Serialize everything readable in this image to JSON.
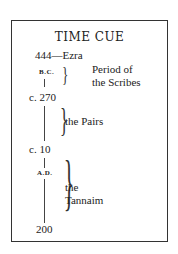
{
  "title": "TIME CUE",
  "timeline": {
    "start": "444—Ezra",
    "bc_label": "B.C.",
    "c270": "c. 270",
    "c10": "c. 10",
    "ad_label": "A.D.",
    "end": "200"
  },
  "periods": [
    {
      "line1": "Period of",
      "line2": "the Scribes"
    },
    {
      "line1": "the Pairs"
    },
    {
      "line1": "the",
      "line2": "Tannaim"
    }
  ]
}
